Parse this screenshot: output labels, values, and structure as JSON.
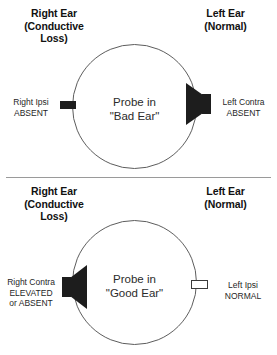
{
  "figure": {
    "type": "diagram",
    "colors": {
      "ink": "#1a1a1a",
      "circle_stroke": "#5d5d5d",
      "filled_transducer": "#1d1d1d",
      "open_probe_fill": "#ffffff",
      "divider": "#9a9a9a",
      "background": "#ffffff"
    }
  },
  "panels": [
    {
      "id": "probe-in-bad-ear",
      "heading_right": {
        "line1": "Right Ear",
        "line2": "(Conductive",
        "line3": "Loss)"
      },
      "heading_left": {
        "line1": "Left Ear",
        "line2": "(Normal)"
      },
      "center": {
        "line1": "Probe in",
        "line2": "\"Bad Ear\""
      },
      "left_note": {
        "line1": "Right Ipsi",
        "line2": "ABSENT"
      },
      "right_note": {
        "line1": "Left Contra",
        "line2": "ABSENT"
      },
      "left_device": "probe-filled",
      "right_device": "speaker-cone"
    },
    {
      "id": "probe-in-good-ear",
      "heading_right": {
        "line1": "Right Ear",
        "line2": "(Conductive",
        "line3": "Loss)"
      },
      "heading_left": {
        "line1": "Left Ear",
        "line2": "(Normal)"
      },
      "center": {
        "line1": "Probe in",
        "line2": "\"Good Ear\""
      },
      "left_note": {
        "line1": "Right Contra",
        "line2": "ELEVATED",
        "line3": "or ABSENT"
      },
      "right_note": {
        "line1": "Left Ipsi",
        "line2": "NORMAL"
      },
      "left_device": "speaker-cone",
      "right_device": "probe-open"
    }
  ]
}
